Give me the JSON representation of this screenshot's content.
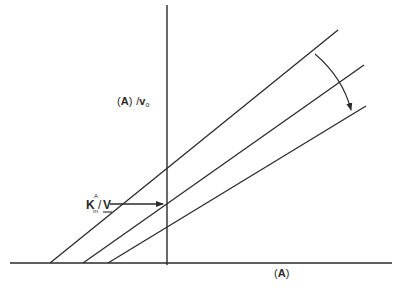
{
  "diagram": {
    "y_axis_label": {
      "open": "(",
      "var": "A",
      "close": ")",
      "slash": "/",
      "v": "v",
      "sub": "o"
    },
    "x_axis_label": {
      "open": "(",
      "var": "A",
      "close": ")"
    },
    "intercept_label": {
      "k": "K",
      "sub": "m",
      "sup": "A",
      "slash": "/",
      "v": "V"
    },
    "colors": {
      "line": "#2a2a2a",
      "background": "#ffffff"
    },
    "lines": [
      {
        "name": "line-1",
        "x1": 50,
        "y1": 263,
        "x2": 338,
        "y2": 30
      },
      {
        "name": "line-2",
        "x1": 83,
        "y1": 263,
        "x2": 364,
        "y2": 65
      },
      {
        "name": "line-3",
        "x1": 108,
        "y1": 263,
        "x2": 366,
        "y2": 106
      }
    ],
    "intersection_point": {
      "x": 167,
      "y": 204
    }
  }
}
